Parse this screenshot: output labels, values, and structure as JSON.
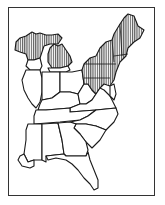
{
  "map": {
    "region": "Eastern United States",
    "style": "black-and-white outline map with vertical hatching",
    "colors": {
      "outline": "#1a1a1a",
      "background": "#ffffff",
      "hatch": "#333333",
      "frame": "#333333"
    },
    "legend": null,
    "hatched_regions": [
      "Michigan Upper Peninsula",
      "Northern Lower Michigan",
      "New York",
      "Pennsylvania",
      "New Jersey (northern)",
      "Vermont",
      "New Hampshire",
      "Maine",
      "Massachusetts",
      "Connecticut",
      "Rhode Island",
      "Maryland (western/northern)"
    ],
    "unhatched_regions": [
      "Wisconsin (southern)",
      "Illinois",
      "Indiana",
      "Ohio",
      "Kentucky",
      "West Virginia",
      "Virginia",
      "Tennessee",
      "North Carolina",
      "South Carolina",
      "Georgia",
      "Alabama",
      "Mississippi",
      "Louisiana (eastern)",
      "Florida",
      "Delaware"
    ]
  }
}
